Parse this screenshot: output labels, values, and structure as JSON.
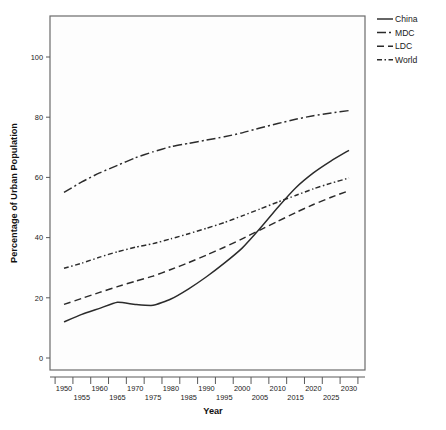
{
  "chart_data": {
    "type": "line",
    "title": "",
    "xlabel": "Year",
    "ylabel": "Percentage of Urban Population",
    "xlim": [
      1950,
      2030
    ],
    "ylim": [
      0,
      110
    ],
    "grid": false,
    "legend_position": "top-right",
    "y_ticks": [
      0,
      20,
      40,
      60,
      80,
      100
    ],
    "y_tick_labels": [
      "0",
      "20",
      "40",
      "60",
      "80",
      "100"
    ],
    "x_ticks": [
      1950,
      1955,
      1960,
      1965,
      1970,
      1975,
      1980,
      1985,
      1990,
      1995,
      2000,
      2005,
      2010,
      2015,
      2020,
      2025,
      2030
    ],
    "x_tick_labels_row1": [
      "1950",
      "1960",
      "1970",
      "1980",
      "1990",
      "2000",
      "2010",
      "2020",
      "2030"
    ],
    "x_tick_labels_row2": [
      "1955",
      "1965",
      "1975",
      "1985",
      "1995",
      "2005",
      "2015",
      "2025"
    ],
    "x": [
      1950,
      1955,
      1960,
      1965,
      1970,
      1975,
      1980,
      1985,
      1990,
      1995,
      2000,
      2005,
      2010,
      2015,
      2020,
      2025,
      2030
    ],
    "series": [
      {
        "name": "China",
        "linestyle": "solid",
        "dasharray": "none",
        "color": "#2b2b2b",
        "values": [
          12.0,
          14.5,
          16.5,
          18.5,
          17.8,
          17.5,
          19.6,
          23.0,
          27.0,
          31.5,
          36.5,
          43.0,
          50.0,
          56.5,
          61.5,
          65.5,
          69.0
        ]
      },
      {
        "name": "MDC",
        "linestyle": "dash-dot",
        "dasharray": "9,3,2,3",
        "color": "#2b2b2b",
        "values": [
          55.0,
          58.5,
          61.5,
          64.0,
          66.5,
          68.5,
          70.2,
          71.3,
          72.4,
          73.5,
          74.8,
          76.4,
          77.9,
          79.3,
          80.5,
          81.4,
          82.2
        ]
      },
      {
        "name": "LDC",
        "linestyle": "dashed",
        "dasharray": "7,4",
        "color": "#2b2b2b",
        "values": [
          17.8,
          19.8,
          21.8,
          23.7,
          25.5,
          27.2,
          29.4,
          31.7,
          34.2,
          36.8,
          39.6,
          42.5,
          45.4,
          48.3,
          51.0,
          53.4,
          55.6
        ]
      },
      {
        "name": "World",
        "linestyle": "short-dash-dot",
        "dasharray": "5,2.5,1.5,2.5",
        "color": "#2b2b2b",
        "values": [
          29.8,
          31.5,
          33.5,
          35.3,
          36.8,
          38.0,
          39.6,
          41.3,
          43.1,
          45.0,
          47.2,
          49.5,
          51.8,
          54.0,
          56.2,
          58.1,
          59.8
        ]
      }
    ]
  },
  "legend": {
    "entries": [
      {
        "label": "China"
      },
      {
        "label": "MDC"
      },
      {
        "label": "LDC"
      },
      {
        "label": "World"
      }
    ]
  },
  "axes": {
    "x_title": "Year",
    "y_title": "Percentage of Urban Population"
  }
}
